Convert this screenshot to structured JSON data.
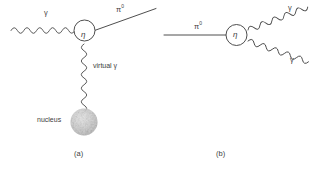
{
  "figure": {
    "background_color": "#ffffff",
    "line_color": "#3a3a3a",
    "nucleus_color": "#bdbdbd"
  },
  "panels": [
    {
      "id": "a",
      "caption": "(a)",
      "vertex_label": "η",
      "labels": {
        "incoming_photon": "γ",
        "outgoing_pion": "π",
        "outgoing_pion_superscript": "0",
        "virtual_photon": "virtual γ",
        "nucleus": "nucleus"
      }
    },
    {
      "id": "b",
      "caption": "(b)",
      "vertex_label": "η",
      "labels": {
        "incoming_pion": "π",
        "incoming_pion_superscript": "0",
        "outgoing_photon_upper": "γ",
        "outgoing_photon_lower": "γ"
      }
    }
  ]
}
